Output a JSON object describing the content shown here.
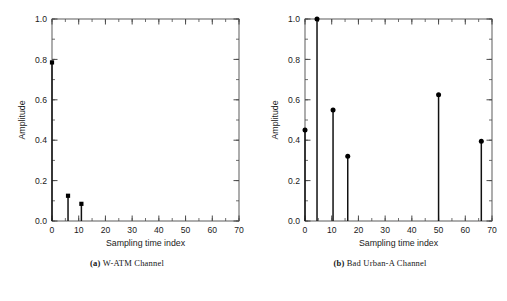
{
  "figure": {
    "panels": [
      {
        "id": "panel-a",
        "caption_prefix": "(a)",
        "caption_text": "W-ATM Channel",
        "chart_data": {
          "type": "bar",
          "subtype": "stem",
          "title": "",
          "xlabel": "Sampling time index",
          "ylabel": "Amplitude",
          "xlim": [
            0,
            70
          ],
          "ylim": [
            0.0,
            1.0
          ],
          "xticks": [
            0,
            10,
            20,
            30,
            40,
            50,
            60,
            70
          ],
          "xtick_labels": [
            "0",
            "10",
            "20",
            "30",
            "40",
            "50",
            "60",
            "70"
          ],
          "yticks": [
            0.0,
            0.2,
            0.4,
            0.6,
            0.8,
            1.0
          ],
          "ytick_labels": [
            "0.0",
            "0.2",
            "0.4",
            "0.6",
            "0.8",
            "1.0"
          ],
          "x_minor_step": 5,
          "y_minor_step": 0.1,
          "grid": false,
          "legend": false,
          "marker": "filled-square",
          "x": [
            0,
            6,
            11
          ],
          "values": [
            0.785,
            0.125,
            0.085
          ]
        }
      },
      {
        "id": "panel-b",
        "caption_prefix": "(b)",
        "caption_text": "Bad Urban-A Channel",
        "chart_data": {
          "type": "bar",
          "subtype": "stem",
          "title": "",
          "xlabel": "Sampling time index",
          "ylabel": "Amplitude",
          "xlim": [
            0,
            70
          ],
          "ylim": [
            0.0,
            1.0
          ],
          "xticks": [
            0,
            10,
            20,
            30,
            40,
            50,
            60,
            70
          ],
          "xtick_labels": [
            "0",
            "10",
            "20",
            "30",
            "40",
            "50",
            "60",
            "70"
          ],
          "yticks": [
            0.0,
            0.2,
            0.4,
            0.6,
            0.8,
            1.0
          ],
          "ytick_labels": [
            "0.0",
            "0.2",
            "0.4",
            "0.6",
            "0.8",
            "1.0"
          ],
          "x_minor_step": 5,
          "y_minor_step": 0.1,
          "grid": false,
          "legend": false,
          "marker": "filled-circle",
          "x": [
            0,
            4.5,
            10.5,
            16,
            50,
            66
          ],
          "values": [
            0.45,
            1.0,
            0.55,
            0.32,
            0.625,
            0.395
          ]
        }
      }
    ],
    "colors": {
      "axis": "#4a4a4a",
      "stem": "#111111",
      "marker": "#000000",
      "text": "#1a1a1a",
      "background": "#ffffff"
    }
  }
}
